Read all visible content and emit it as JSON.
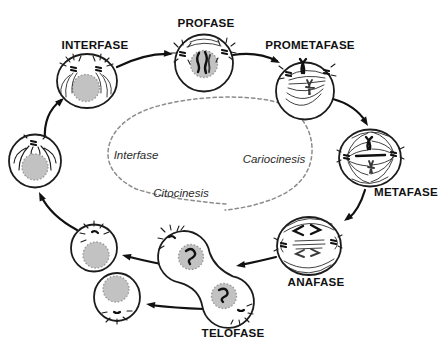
{
  "diagram_title": "Ciclo celular - Mitosis",
  "phases": {
    "interfase": {
      "label": "INTERFASE"
    },
    "profase": {
      "label": "PROFASE"
    },
    "prometafase": {
      "label": "PROMETAFASE"
    },
    "metafase": {
      "label": "METAFASE"
    },
    "anafase": {
      "label": "ANAFASE"
    },
    "telofase": {
      "label": "TELOFASE"
    }
  },
  "inner_labels": {
    "interfase": "Interfase",
    "cariocinesis": "Cariocinesis",
    "citocinesis": "Citocinesis"
  },
  "colors": {
    "background": "#ffffff",
    "line": "#1c1c1c",
    "nucleus_fill": "#c2c2c2",
    "dashed_cycle": "#8c8c8c"
  }
}
